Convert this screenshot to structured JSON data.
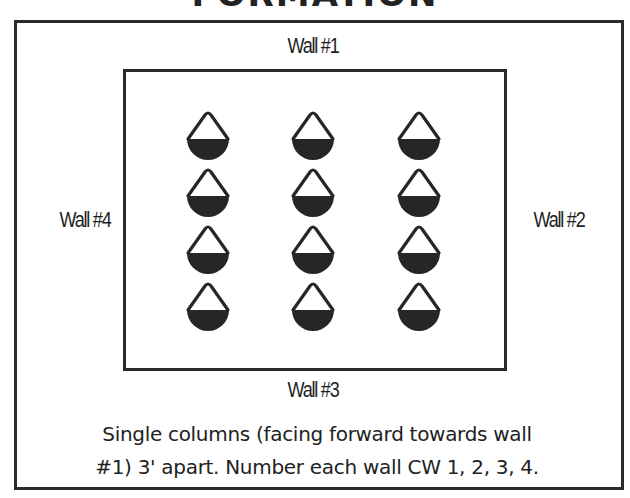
{
  "title": "FORMATION",
  "walls": {
    "wall_1": "Wall #1",
    "wall_2": "Wall #2",
    "wall_3": "Wall #3",
    "wall_4": "Wall #4"
  },
  "formation": {
    "columns": 3,
    "rows": 4,
    "figure_icon": "person-top-view-icon",
    "figure_count": 12,
    "fill_color": "#262626",
    "stroke_color": "#262626"
  },
  "caption": {
    "line_1": "Single columns (facing forward towards wall",
    "line_2": "#1) 3' apart. Number each wall CW 1, 2, 3, 4."
  }
}
